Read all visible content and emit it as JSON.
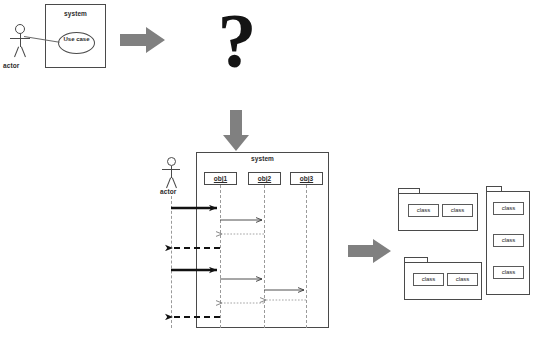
{
  "diagram": {
    "question_glyph": "?"
  },
  "usecase_diagram": {
    "system_label": "system",
    "usecase_label": "Use case",
    "actor_label": "actor"
  },
  "sequence_diagram": {
    "system_label": "system",
    "actor_label": "actor",
    "objects": [
      {
        "label": "obj1"
      },
      {
        "label": "obj2"
      },
      {
        "label": "obj3"
      }
    ]
  },
  "class_diagram": {
    "packages": [
      {
        "classes": [
          {
            "label": "class"
          },
          {
            "label": "class"
          }
        ]
      },
      {
        "classes": [
          {
            "label": "class"
          },
          {
            "label": "class"
          },
          {
            "label": "class"
          }
        ]
      },
      {
        "classes": [
          {
            "label": "class"
          },
          {
            "label": "class"
          }
        ]
      }
    ]
  },
  "icons": {
    "arrow_right_1": "gray-block-arrow-right-icon",
    "arrow_down": "gray-block-arrow-down-icon",
    "arrow_right_2": "gray-block-arrow-right-icon"
  },
  "caption": {
    "text": ""
  },
  "colors": {
    "stroke": "#4a4a4a",
    "lifeline": "#9a9a9a",
    "block_arrow": "#808080",
    "question": "#141414",
    "background": "#ffffff"
  }
}
